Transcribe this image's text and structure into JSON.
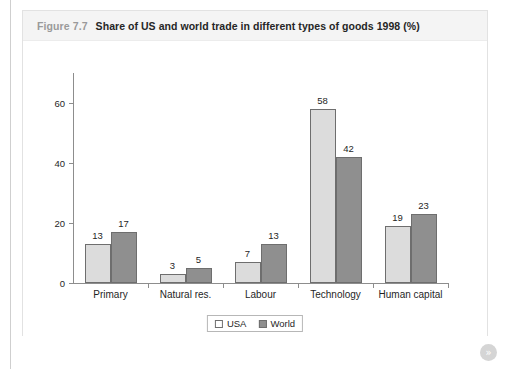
{
  "figure": {
    "number": "Figure 7.7",
    "title": "Share of US and world trade in different types of goods 1998 (%)"
  },
  "pager": {
    "next_label": "»",
    "icon": "double-chevron-right-icon"
  },
  "chart_data": {
    "type": "bar",
    "title": "Share of US and world trade in different types of goods 1998 (%)",
    "xlabel": "",
    "ylabel": "",
    "ylim": [
      0,
      70
    ],
    "yticks": [
      0,
      20,
      40,
      60
    ],
    "ytick_labels": [
      "0",
      "20",
      "40",
      "60"
    ],
    "grid": false,
    "legend_position": "bottom-center",
    "categories": [
      "Primary",
      "Natural res.",
      "Labour",
      "Technology",
      "Human capital"
    ],
    "series": [
      {
        "name": "USA",
        "color": "#dcdcdc",
        "values": [
          13,
          3,
          7,
          58,
          19
        ],
        "value_labels": [
          "13",
          "3",
          "7",
          "58",
          "19"
        ]
      },
      {
        "name": "World",
        "color": "#8f8f8f",
        "values": [
          17,
          5,
          13,
          42,
          23
        ],
        "value_labels": [
          "17",
          "5",
          "13",
          "42",
          "23"
        ]
      }
    ]
  }
}
